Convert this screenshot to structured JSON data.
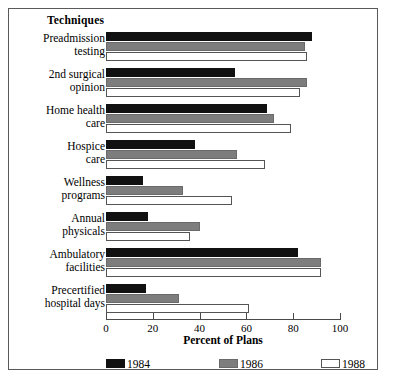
{
  "chart": {
    "title": "Techniques",
    "xlabel": "Percent of Plans"
  },
  "axis": {
    "ticks": [
      {
        "value": 0,
        "label": "0"
      },
      {
        "value": 20,
        "label": "20"
      },
      {
        "value": 40,
        "label": "40"
      },
      {
        "value": 60,
        "label": "60"
      },
      {
        "value": 80,
        "label": "80"
      },
      {
        "value": 100,
        "label": "100"
      }
    ]
  },
  "legend": [
    {
      "label": "1984",
      "color": "#111111",
      "key": "y1984"
    },
    {
      "label": "1986",
      "color": "#7d7d7d",
      "key": "y1986"
    },
    {
      "label": "1988",
      "color": "#ffffff",
      "key": "y1988"
    }
  ],
  "categories": [
    {
      "line1": "Preadmission",
      "line2": "testing"
    },
    {
      "line1": "2nd surgical",
      "line2": "opinion"
    },
    {
      "line1": "Home health",
      "line2": "care"
    },
    {
      "line1": "Hospice",
      "line2": "care"
    },
    {
      "line1": "Wellness",
      "line2": "programs"
    },
    {
      "line1": "Annual",
      "line2": "physicals"
    },
    {
      "line1": "Ambulatory",
      "line2": "facilities"
    },
    {
      "line1": "Precertified",
      "line2": "hospital days"
    }
  ],
  "chart_data": {
    "type": "bar",
    "orientation": "horizontal",
    "title": "Techniques",
    "xlabel": "Percent of Plans",
    "ylabel": "",
    "xlim": [
      0,
      100
    ],
    "grid": false,
    "legend_position": "bottom",
    "categories": [
      "Preadmission testing",
      "2nd surgical opinion",
      "Home health care",
      "Hospice care",
      "Wellness programs",
      "Annual physicals",
      "Ambulatory facilities",
      "Precertified hospital days"
    ],
    "series": [
      {
        "name": "1984",
        "color": "#111111",
        "values": [
          88,
          55,
          69,
          38,
          16,
          18,
          82,
          17
        ]
      },
      {
        "name": "1986",
        "color": "#7d7d7d",
        "values": [
          85,
          86,
          72,
          56,
          33,
          40,
          92,
          31
        ]
      },
      {
        "name": "1988",
        "color": "#ffffff",
        "values": [
          86,
          83,
          79,
          68,
          54,
          36,
          92,
          61
        ]
      }
    ]
  }
}
